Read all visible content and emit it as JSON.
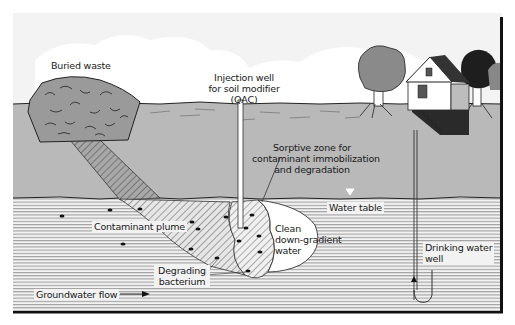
{
  "diagram": {
    "type": "cross-section illustration",
    "colors": {
      "sky": "#f4f4f4",
      "soil": "#b9b9b9",
      "groundwater_bg": "#f2f2f2",
      "groundwater_lines": "#8a8a8a",
      "waste": "#9a9a9a",
      "plume_hatch": "#555555",
      "border": "#111111",
      "clean_water": "#ffffff"
    },
    "labels": {
      "buried_waste": "Buried waste",
      "injection_well_line1": "Injection well",
      "injection_well_line2": "for soil modifier",
      "injection_well_line3": "(QAC)",
      "sorptive_zone_line1": "Sorptive zone for",
      "sorptive_zone_line2": "contaminant immobilization",
      "sorptive_zone_line3": "and degradation",
      "water_table": "Water table",
      "contaminant_plume": "Contaminant plume",
      "clean_line1": "Clean",
      "clean_line2": "down-gradient",
      "clean_line3": "water",
      "degrading_line1": "Degrading",
      "degrading_line2": "bacterium",
      "drinking_line1": "Drinking water",
      "drinking_line2": "well",
      "groundwater_flow": "Groundwater flow"
    },
    "components": [
      {
        "name": "Buried waste",
        "layer": "unsaturated soil"
      },
      {
        "name": "Injection well",
        "note": "for soil modifier (QAC)"
      },
      {
        "name": "Contaminant plume",
        "layer": "aquifer"
      },
      {
        "name": "Sorptive zone",
        "purpose": "contaminant immobilization and degradation"
      },
      {
        "name": "Clean down-gradient water"
      },
      {
        "name": "Degrading bacterium"
      },
      {
        "name": "Water table"
      },
      {
        "name": "Drinking water well"
      },
      {
        "name": "House"
      },
      {
        "name": "Trees"
      },
      {
        "name": "Groundwater flow",
        "direction": "left-to-right"
      }
    ]
  }
}
